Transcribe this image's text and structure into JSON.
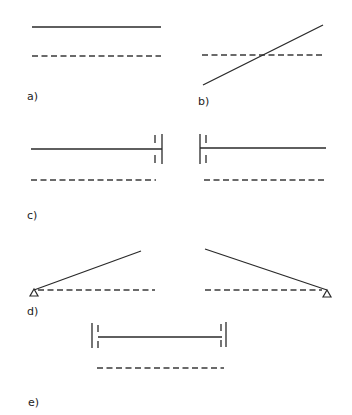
{
  "figure": {
    "colors": {
      "line": "#2a2a2a",
      "background": "#ffffff"
    },
    "panels": [
      {
        "id": "a",
        "label": "a)",
        "description": "solid line parallel above dashed line"
      },
      {
        "id": "b",
        "label": "b)",
        "description": "inclined solid line crossing dashed line"
      },
      {
        "id": "c",
        "label": "c)",
        "description": "two members each fixed at wall (double vertical lines) with dashed reference below"
      },
      {
        "id": "d",
        "label": "d)",
        "description": "two inclined members pinned at triangular supports with dashed reference"
      },
      {
        "id": "e",
        "label": "e)",
        "description": "member between two walls with dashed reference below"
      }
    ],
    "legend": {
      "solid": "member line",
      "dashed": "reference line",
      "double-vertical-lines": "fixed wall / clamp",
      "triangle": "pin support"
    }
  }
}
